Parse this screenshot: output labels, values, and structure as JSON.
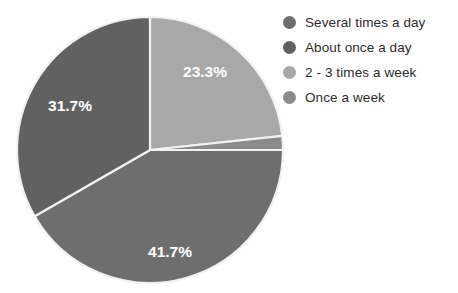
{
  "chart_data": {
    "type": "pie",
    "title": "",
    "labels": [
      "Several times a day",
      "About once a day",
      "2 - 3 times a week",
      "Once a week"
    ],
    "values": [
      41.7,
      31.7,
      23.3,
      3.3
    ],
    "value_labels": [
      "41.7%",
      "31.7%",
      "23.3%",
      ""
    ],
    "colors": [
      "#6e6e6e",
      "#616161",
      "#a8a8a8",
      "#8a8a8a"
    ],
    "units": "percent",
    "legend_position": "right",
    "grid": false,
    "slice_label_color": "#ffffff",
    "background_color": "#ffffff",
    "slice_border_color": "#f2f2f2",
    "slices": [
      {
        "label": "2 - 3 times a week",
        "value": 23.3,
        "display": "23.3%",
        "color": "#a8a8a8",
        "start_angle": 0,
        "end_angle": 83.9,
        "label_x": 205,
        "label_y": 73
      },
      {
        "label": "Once a week",
        "value": 3.3,
        "display": "",
        "color": "#8a8a8a",
        "start_angle": 83.9,
        "end_angle": 90,
        "label_x": 232,
        "label_y": 143
      },
      {
        "label": "Several times a day",
        "value": 41.7,
        "display": "41.7%",
        "color": "#6e6e6e",
        "start_angle": 90,
        "end_angle": 240.1,
        "label_x": 170,
        "label_y": 253
      },
      {
        "label": "About once a day",
        "value": 31.7,
        "display": "31.7%",
        "color": "#616161",
        "start_angle": 240.1,
        "end_angle": 360,
        "label_x": 70,
        "label_y": 107
      }
    ],
    "geometry": {
      "center_x": 150,
      "center_y": 150,
      "radius": 133
    }
  },
  "legend": {
    "items": [
      {
        "label": "Several times a day",
        "color": "#6e6e6e"
      },
      {
        "label": "About once a day",
        "color": "#616161"
      },
      {
        "label": "2 - 3 times a week",
        "color": "#a8a8a8"
      },
      {
        "label": "Once a week",
        "color": "#8a8a8a"
      }
    ]
  }
}
